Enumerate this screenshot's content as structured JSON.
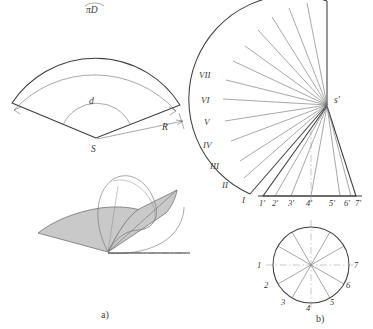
{
  "figure": {
    "title_none": "",
    "panels": [
      {
        "id": "a",
        "caption": "a)"
      },
      {
        "id": "b",
        "caption": "b)"
      }
    ]
  },
  "panel_a": {
    "development_sector": {
      "arc_length_label": "πD",
      "apex_label": "S",
      "angle_label": "d",
      "radius_label": "R"
    },
    "cone_unroll": {
      "shaded_color": "#c9c9c9",
      "outline_color": "#3c3c3c"
    },
    "caption": "a)"
  },
  "panel_b": {
    "fan_development": {
      "apex_label": "s'",
      "generatrix_labels": [
        "I",
        "II",
        "III",
        "IV",
        "V",
        "VI",
        "VII"
      ],
      "division_count": 12
    },
    "front_view_triangle": {
      "baseline_labels": [
        "1'",
        "2'",
        "3'",
        "4'",
        "5'",
        "6'",
        "7'"
      ]
    },
    "top_view_circle": {
      "point_labels": [
        "1",
        "2",
        "3",
        "4",
        "5",
        "6",
        "7"
      ],
      "division_count": 12
    },
    "caption": "b)"
  },
  "colors": {
    "line": "#3c3c3c",
    "thin_line": "#6d6d6d",
    "shade": "#c9c9c9",
    "text": "#3a3a3a",
    "background": "#ffffff"
  }
}
